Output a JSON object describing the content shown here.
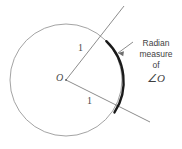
{
  "figure": {
    "type": "geometry-diagram",
    "center_label": "O",
    "radius_upper_label": "1",
    "radius_lower_label": "1",
    "callout": {
      "line1": "Radian",
      "line2": "measure",
      "line3": "of",
      "line4": "∠O",
      "angle_symbol": "∠",
      "angle_vertex": "O"
    },
    "colors": {
      "circle_stroke": "#8c8c8c",
      "ray_stroke": "#6e6e6e",
      "arc_stroke": "#1a1a1a",
      "text": "#4a4a4a",
      "background": "#ffffff"
    },
    "geometry": {
      "center_x": 66,
      "center_y": 80,
      "radius": 56,
      "arc_start_angle_deg": -44,
      "arc_end_angle_deg": 30,
      "circle_stroke_width": 0.8,
      "arc_stroke_width": 2.4
    }
  }
}
